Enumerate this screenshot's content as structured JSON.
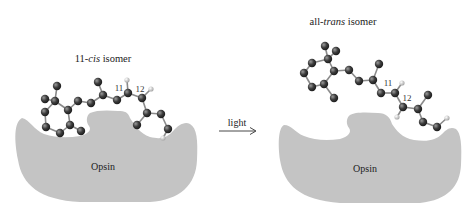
{
  "left_panel": {
    "title_prefix": "11-",
    "title_italic": "cis",
    "title_suffix": " isomer",
    "protein_label": "Opsin",
    "bond_labels": [
      "11",
      "12"
    ]
  },
  "right_panel": {
    "title_prefix": "all-",
    "title_italic": "trans",
    "title_suffix": " isomer",
    "protein_label": "Opsin",
    "bond_labels": [
      "11",
      "12"
    ]
  },
  "arrow": {
    "label": "light"
  },
  "colors": {
    "protein": "#c4c4c4",
    "carbon": "#3a3a3a",
    "hydrogen": "#d8d8d8",
    "bond": "#8a8a8a",
    "text": "#222222"
  }
}
